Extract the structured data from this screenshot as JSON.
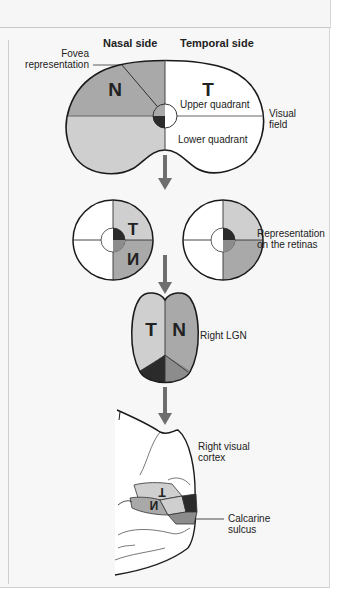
{
  "figure": {
    "headers": {
      "nasal": "Nasal side",
      "temporal": "Temporal side"
    },
    "visual_field": {
      "nasal_letter": "N",
      "temporal_letter": "T",
      "upper_label": "Upper quadrant",
      "lower_label": "Lower quadrant",
      "side_label_line1": "Visual",
      "side_label_line2": "field",
      "fovea_line1": "Fovea",
      "fovea_line2": "representation"
    },
    "retinas": {
      "left_letter_top": "T",
      "left_letter_bottom": "N",
      "label_line1": "Representation",
      "label_line2": "on the retinas"
    },
    "lgn": {
      "left_letter": "T",
      "right_letter": "N",
      "label": "Right LGN"
    },
    "cortex": {
      "label_line1": "Right visual",
      "label_line2": "cortex",
      "letter_upper": "T",
      "letter_lower": "N",
      "sulcus_line1": "Calcarine",
      "sulcus_line2": "sulcus"
    },
    "colors": {
      "nasal_upper": "#a9a9a9",
      "nasal_lower": "#cfcfcf",
      "temporal": "#ffffff",
      "fovea_dark": "#2b2b2b",
      "fovea_mid": "#8c8c8c",
      "arrow": "#6e6e6e",
      "outline": "#1a1a1a"
    }
  }
}
